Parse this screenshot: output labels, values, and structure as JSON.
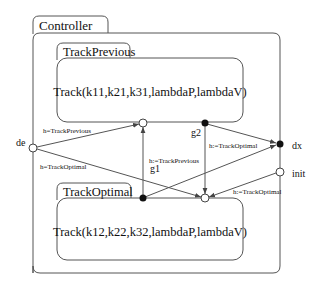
{
  "states": {
    "controller": {
      "label": "Controller"
    },
    "track_previous": {
      "label": "TrackPrevious",
      "body": "Track(k11,k21,k31,lambdaP,lambdaV)"
    },
    "track_optimal": {
      "label": "TrackOptimal",
      "body": "Track(k12,k22,k32,lambdaP,lambdaV)"
    }
  },
  "ports": {
    "de": {
      "label": "de",
      "type": "input"
    },
    "dx": {
      "label": "dx",
      "type": "output"
    },
    "init": {
      "label": "init",
      "type": "input"
    },
    "g1": {
      "label": "g1",
      "type": "exit"
    },
    "g2": {
      "label": "g2",
      "type": "exit"
    }
  },
  "transitions": [
    {
      "from": "de",
      "to": "TrackPrevious",
      "label": "h=TrackPrevious"
    },
    {
      "from": "de",
      "to": "TrackOptimal",
      "label": "h=TrackOptimal"
    },
    {
      "from": "g1",
      "to": "TrackPrevious",
      "label": "h:=TrackPrevious"
    },
    {
      "from": "g1",
      "to": "dx",
      "label": ""
    },
    {
      "from": "g2",
      "to": "TrackOptimal",
      "label": ""
    },
    {
      "from": "g2",
      "to": "dx",
      "label": "h:=TrackOptimal"
    },
    {
      "from": "init",
      "to": "TrackOptimal",
      "label": "h:=TrackOptimal"
    }
  ]
}
